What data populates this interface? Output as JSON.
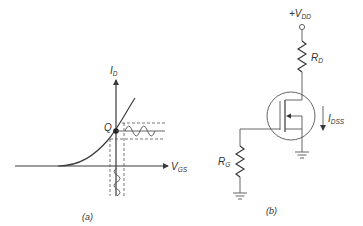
{
  "panel_a": {
    "caption": "(a)",
    "y_axis_label": "I",
    "y_axis_sub": "D",
    "x_axis_label": "V",
    "x_axis_sub": "GS",
    "q_point_label": "Q"
  },
  "panel_b": {
    "caption": "(b)",
    "supply_label": "+V",
    "supply_sub": "DD",
    "drain_resistor_label": "R",
    "drain_resistor_sub": "D",
    "gate_resistor_label": "R",
    "gate_resistor_sub": "G",
    "current_label": "I",
    "current_sub": "DSS"
  }
}
